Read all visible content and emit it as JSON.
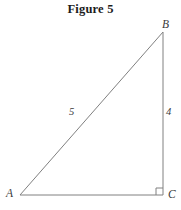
{
  "figure": {
    "title": "Figure 5",
    "background_color": "#ffffff",
    "stroke_color": "#808080",
    "text_color": "#3a3a3a",
    "title_color": "#1c1c1c"
  },
  "diagram": {
    "type": "right-triangle",
    "vertices": [
      {
        "name": "A",
        "label": "A",
        "x": 20,
        "y": 195,
        "role": "bottom-left"
      },
      {
        "name": "B",
        "label": "B",
        "x": 163,
        "y": 32,
        "role": "top-right"
      },
      {
        "name": "C",
        "label": "C",
        "x": 163,
        "y": 195,
        "role": "bottom-right"
      }
    ],
    "sides": [
      {
        "name": "AB",
        "label": "5",
        "role": "hypotenuse",
        "from": "A",
        "to": "B"
      },
      {
        "name": "BC",
        "label": "4",
        "role": "vertical-leg",
        "from": "B",
        "to": "C"
      },
      {
        "name": "AC",
        "label": "",
        "role": "horizontal-leg",
        "from": "A",
        "to": "C"
      }
    ],
    "right_angle": {
      "at_vertex": "C",
      "marker": "square",
      "size": 7
    }
  }
}
